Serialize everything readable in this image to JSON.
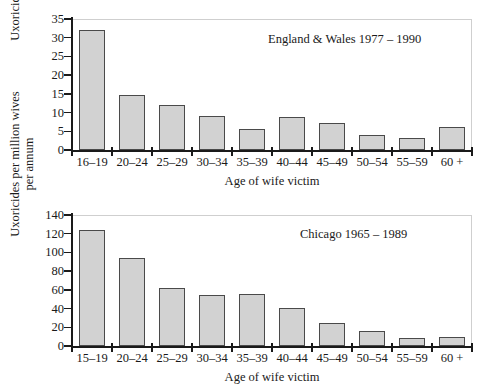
{
  "figure": {
    "background": "#ffffff",
    "bar_fill": "#d2d2d2",
    "bar_edge": "#4a4a4a",
    "axis_color": "#1a1a1a"
  },
  "chart_data": [
    {
      "type": "bar",
      "title": "England & Wales 1977 – 1990",
      "xlabel": "Age of wife victim",
      "ylabel": "Uxoricides per million wives per annum",
      "ylabel_line1": "Uxoricides per million wives",
      "ylabel_line2": "per annum",
      "categories": [
        "16–19",
        "20–24",
        "25–29",
        "30–34",
        "35–39",
        "40–44",
        "45–49",
        "50–54",
        "55–59",
        "60 +"
      ],
      "values": [
        32,
        14.8,
        12,
        9.2,
        5.5,
        8.7,
        7.2,
        3.9,
        3.1,
        6.1
      ],
      "yticks": [
        0,
        5,
        10,
        15,
        20,
        25,
        30,
        35
      ],
      "ylim": [
        0,
        35
      ],
      "grid": false,
      "legend": "none"
    },
    {
      "type": "bar",
      "title": "Chicago 1965 – 1989",
      "xlabel": "Age of wife victim",
      "ylabel": "Uxoricides per million wives per annum",
      "ylabel_line1": "Uxoricides per million wives",
      "ylabel_line2": "per annum",
      "categories": [
        "15–19",
        "20–24",
        "25–29",
        "30–34",
        "35–39",
        "40–44",
        "45–49",
        "50–54",
        "55–59",
        "60 +"
      ],
      "values": [
        124,
        94,
        62,
        54,
        55.5,
        41,
        25,
        16.5,
        9,
        9.5
      ],
      "yticks": [
        0,
        20,
        40,
        60,
        80,
        100,
        120,
        140
      ],
      "ylim": [
        0,
        140
      ],
      "grid": false,
      "legend": "none"
    }
  ]
}
